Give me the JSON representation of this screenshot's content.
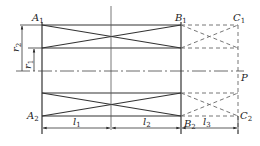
{
  "diagram": {
    "labels": {
      "A1": {
        "main": "A",
        "sub": "1"
      },
      "B1": {
        "main": "B",
        "sub": "1"
      },
      "C1": {
        "main": "C",
        "sub": "1"
      },
      "A2": {
        "main": "A",
        "sub": "2"
      },
      "B2": {
        "main": "B",
        "sub": "2"
      },
      "C2": {
        "main": "C",
        "sub": "2"
      },
      "P": {
        "main": "P"
      },
      "r1": {
        "main": "r",
        "sub": "1"
      },
      "r2": {
        "main": "r",
        "sub": "2"
      },
      "l1": {
        "main": "l",
        "sub": "1"
      },
      "l2": {
        "main": "l",
        "sub": "2"
      },
      "l3": {
        "main": "l",
        "sub": "3"
      }
    },
    "colors": {
      "line": "#333333",
      "dashed": "#666666",
      "background": "#ffffff"
    }
  }
}
